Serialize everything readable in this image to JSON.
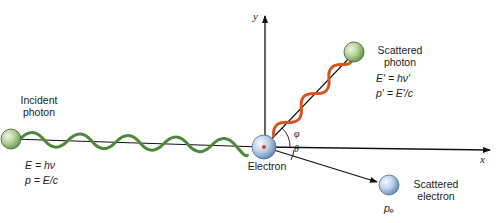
{
  "diagram": {
    "axes": {
      "x_label": "x",
      "y_label": "y"
    },
    "incident_photon": {
      "label_line1": "Incident",
      "label_line2": "photon",
      "energy_eq": "E = hν",
      "momentum_eq": "p = E/c",
      "wave_color": "#4f8a3a"
    },
    "electron": {
      "label": "Electron"
    },
    "scattered_photon": {
      "label_line1": "Scattered",
      "label_line2": "photon",
      "energy_eq": "E′ = hν′",
      "momentum_eq": "p′ = E′/c",
      "wave_color": "#d9531e"
    },
    "scattered_electron": {
      "label_line1": "Scattered",
      "label_line2": "electron",
      "momentum_label": "pₑ"
    },
    "angles": {
      "photon_angle": "φ",
      "electron_angle": "θ"
    },
    "colors": {
      "photon_sphere": "#a9c98a",
      "electron_sphere": "#b8cde6",
      "line": "#111111"
    }
  }
}
